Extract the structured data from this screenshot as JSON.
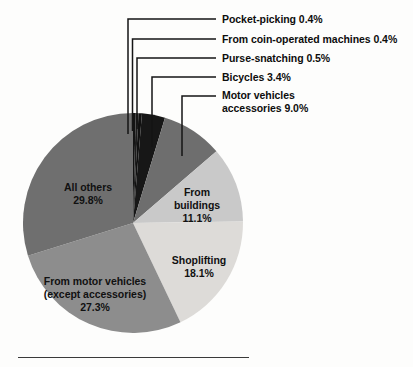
{
  "chart_data": {
    "type": "pie",
    "title": "",
    "subtitle": "",
    "xlabel": "",
    "ylabel": "",
    "legend_position": "callout-labels",
    "grid": false,
    "units": "percent",
    "categories": [
      "Pocket-picking",
      "From coin-operated machines",
      "Purse-snatching",
      "Bicycles",
      "Motor vehicles accessories",
      "From buildings",
      "Shoplifting",
      "From motor vehicles (except accessories)",
      "All others"
    ],
    "values": [
      0.4,
      0.4,
      0.5,
      3.4,
      9.0,
      11.1,
      18.1,
      27.3,
      29.8
    ],
    "value_labels": [
      "0.4%",
      "0.4%",
      "0.5%",
      "3.4%",
      "9.0%",
      "11.1%",
      "18.1%",
      "27.3%",
      "29.8%"
    ],
    "colors": [
      "#141414",
      "#1d1d1d",
      "#111111",
      "#171717",
      "#6e6e6e",
      "#c9c9c9",
      "#dddbd8",
      "#8d8d8d",
      "#6f6f6f"
    ],
    "start_angle_deg": 0,
    "direction": "clockwise",
    "slices": [
      {
        "label": "Pocket-picking",
        "value": 0.4,
        "value_label": "0.4%",
        "color": "#141414",
        "label_style": "callout"
      },
      {
        "label": "From coin-operated machines",
        "value": 0.4,
        "value_label": "0.4%",
        "color": "#1d1d1d",
        "label_style": "callout"
      },
      {
        "label": "Purse-snatching",
        "value": 0.5,
        "value_label": "0.5%",
        "color": "#111111",
        "label_style": "callout"
      },
      {
        "label": "Bicycles",
        "value": 3.4,
        "value_label": "3.4%",
        "color": "#171717",
        "label_style": "callout"
      },
      {
        "label": "Motor vehicles accessories",
        "value": 9.0,
        "value_label": "9.0%",
        "color": "#6e6e6e",
        "label_style": "callout"
      },
      {
        "label": "From buildings",
        "value": 11.1,
        "value_label": "11.1%",
        "color": "#c9c9c9",
        "label_style": "inside"
      },
      {
        "label": "Shoplifting",
        "value": 18.1,
        "value_label": "18.1%",
        "color": "#dddbd8",
        "label_style": "inside"
      },
      {
        "label": "From motor vehicles (except accessories)",
        "value": 27.3,
        "value_label": "27.3%",
        "color": "#8d8d8d",
        "label_style": "inside"
      },
      {
        "label": "All others",
        "value": 29.8,
        "value_label": "29.8%",
        "color": "#6f6f6f",
        "label_style": "inside"
      }
    ]
  },
  "callouts": [
    {
      "id": "pocket-picking",
      "text": "Pocket-picking 0.4%"
    },
    {
      "id": "coin-operated",
      "text": "From coin-operated machines 0.4%"
    },
    {
      "id": "purse-snatching",
      "text": "Purse-snatching 0.5%"
    },
    {
      "id": "bicycles",
      "text": "Bicycles 3.4%"
    },
    {
      "id": "motor-vehicles-accessories-line1",
      "text": "Motor vehicles"
    },
    {
      "id": "motor-vehicles-accessories-line2",
      "text": "accessories 9.0%"
    }
  ],
  "inside_labels": {
    "all_others": {
      "line1": "All others",
      "line2": "29.8%"
    },
    "from_buildings": {
      "line1": "From",
      "line2": "buildings",
      "line3": "11.1%"
    },
    "shoplifting": {
      "line1": "Shoplifting",
      "line2": "18.1%"
    },
    "from_motor_vehicles": {
      "line1": "From motor vehicles",
      "line2": "(except accessories)",
      "line3": "27.3%"
    }
  },
  "style": {
    "background": "#fdfdfc",
    "text_color": "#0d0d0d",
    "leader_color": "#151515",
    "rule_color": "#3a3a3a"
  }
}
